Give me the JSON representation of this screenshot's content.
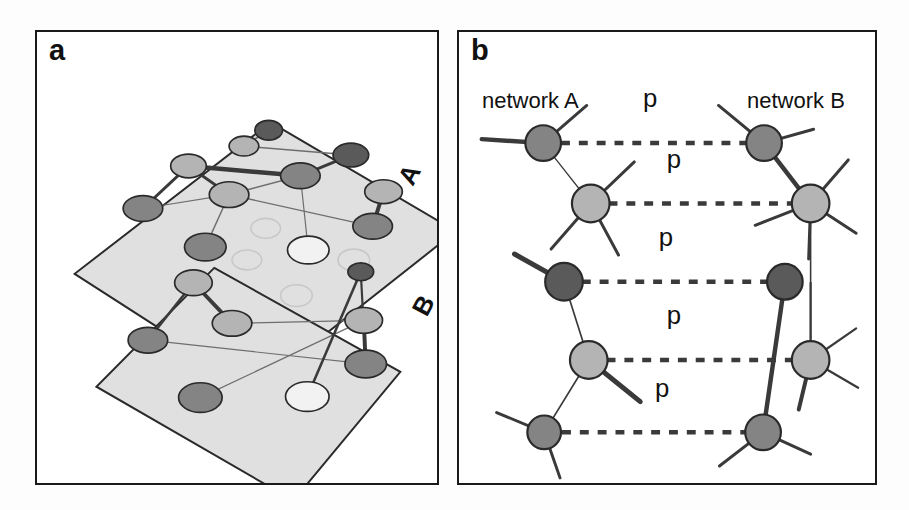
{
  "figure": {
    "width": 909,
    "height": 510,
    "background": "#ffffff",
    "style": "grayscale scientific schematic of two interdependent networks"
  },
  "colors": {
    "node_dark": "#5a5a5a",
    "node_medium": "#848484",
    "node_light": "#b4b4b4",
    "node_pale": "#d2d2d2",
    "node_white": "#f2f2f2",
    "node_stroke": "#2a2a2a",
    "plane_fill": "#e0e0e0",
    "plane_stroke": "#2a2a2a",
    "edge": "#3a3a3a",
    "edge_thin": "#6e6e6e",
    "ghost": "#c8c8c8",
    "frame": "#1a1a1a",
    "text": "#111111"
  },
  "panel_a": {
    "letter": "a",
    "plane_labels": [
      {
        "name": "plane-label-A",
        "text": "A",
        "x": 386,
        "y": 150,
        "rotation": -62
      },
      {
        "name": "plane-label-B",
        "text": "B",
        "x": 400,
        "y": 282,
        "rotation": -62
      }
    ],
    "planes": [
      {
        "name": "plane-A",
        "points": "238,93 425,203 222,363 40,246"
      },
      {
        "name": "plane-B",
        "points": "181,240 369,345 261,475 62,360"
      }
    ],
    "nodes_plane_a": [
      {
        "id": "a1",
        "x": 236,
        "y": 101,
        "rx": 14,
        "ry": 10,
        "shade": "node_dark"
      },
      {
        "id": "a2",
        "x": 211,
        "y": 117,
        "rx": 15,
        "ry": 10,
        "shade": "node_light"
      },
      {
        "id": "a3",
        "x": 319,
        "y": 126,
        "rx": 18,
        "ry": 12,
        "shade": "node_dark"
      },
      {
        "id": "a4",
        "x": 155,
        "y": 137,
        "rx": 18,
        "ry": 12,
        "shade": "node_light"
      },
      {
        "id": "a5",
        "x": 268,
        "y": 147,
        "rx": 20,
        "ry": 13,
        "shade": "node_medium"
      },
      {
        "id": "a6",
        "x": 196,
        "y": 166,
        "rx": 20,
        "ry": 13,
        "shade": "node_light"
      },
      {
        "id": "a7",
        "x": 109,
        "y": 180,
        "rx": 20,
        "ry": 13,
        "shade": "node_medium"
      },
      {
        "id": "a8",
        "x": 352,
        "y": 163,
        "rx": 19,
        "ry": 12,
        "shade": "node_light"
      },
      {
        "id": "a9",
        "x": 341,
        "y": 198,
        "rx": 20,
        "ry": 13,
        "shade": "node_medium"
      },
      {
        "id": "a10",
        "x": 172,
        "y": 219,
        "rx": 21,
        "ry": 14,
        "shade": "node_medium"
      },
      {
        "id": "a11",
        "x": 276,
        "y": 222,
        "rx": 21,
        "ry": 14,
        "shade": "node_white"
      }
    ],
    "ghost_nodes": [
      {
        "id": "g1",
        "x": 233,
        "y": 200,
        "rx": 15,
        "ry": 10
      },
      {
        "id": "g2",
        "x": 214,
        "y": 232,
        "rx": 15,
        "ry": 10
      },
      {
        "id": "g3",
        "x": 322,
        "y": 232,
        "rx": 16,
        "ry": 11
      },
      {
        "id": "g4",
        "x": 264,
        "y": 268,
        "rx": 16,
        "ry": 11
      }
    ],
    "edges_plane_a": [
      {
        "from": "a1",
        "to": "a2",
        "w": 2.0
      },
      {
        "from": "a2",
        "to": "a3",
        "w": 1.6
      },
      {
        "from": "a3",
        "to": "a5",
        "w": 3.0
      },
      {
        "from": "a4",
        "to": "a5",
        "w": 4.5
      },
      {
        "from": "a4",
        "to": "a6",
        "w": 3.0
      },
      {
        "from": "a4",
        "to": "a7",
        "w": 3.0
      },
      {
        "from": "a6",
        "to": "a7",
        "w": 1.2
      },
      {
        "from": "a6",
        "to": "a5",
        "w": 1.6
      },
      {
        "from": "a6",
        "to": "a10",
        "w": 1.4
      },
      {
        "from": "a8",
        "to": "a9",
        "w": 4.0
      },
      {
        "from": "a5",
        "to": "a11",
        "w": 1.2
      },
      {
        "from": "a6",
        "to": "a9",
        "w": 1.4
      }
    ],
    "nodes_plane_b": [
      {
        "id": "b1",
        "x": 160,
        "y": 255,
        "rx": 19,
        "ry": 13,
        "shade": "node_light"
      },
      {
        "id": "b2",
        "x": 332,
        "y": 293,
        "rx": 19,
        "ry": 13,
        "shade": "node_light"
      },
      {
        "id": "b3",
        "x": 199,
        "y": 296,
        "rx": 20,
        "ry": 13,
        "shade": "node_light"
      },
      {
        "id": "b4",
        "x": 114,
        "y": 313,
        "rx": 20,
        "ry": 13,
        "shade": "node_medium"
      },
      {
        "id": "b5",
        "x": 334,
        "y": 337,
        "rx": 21,
        "ry": 14,
        "shade": "node_medium"
      },
      {
        "id": "b6",
        "x": 167,
        "y": 371,
        "rx": 22,
        "ry": 15,
        "shade": "node_medium"
      },
      {
        "id": "b7",
        "x": 275,
        "y": 370,
        "rx": 22,
        "ry": 15,
        "shade": "node_white"
      },
      {
        "id": "b8",
        "x": 329,
        "y": 244,
        "rx": 13,
        "ry": 9,
        "shade": "node_dark"
      }
    ],
    "edges_plane_b": [
      {
        "from": "b1",
        "to": "b3",
        "w": 4.0
      },
      {
        "from": "b1",
        "to": "b4",
        "w": 2.6
      },
      {
        "from": "b2",
        "to": "b5",
        "w": 4.0
      },
      {
        "from": "b3",
        "to": "b2",
        "w": 1.4
      },
      {
        "from": "b4",
        "to": "b5",
        "w": 1.2
      },
      {
        "from": "b6",
        "to": "b2",
        "w": 1.2
      },
      {
        "from": "b7",
        "to": "b8",
        "w": 2.6
      },
      {
        "from": "b5",
        "to": "b8",
        "w": 2.2
      }
    ]
  },
  "panel_b": {
    "letter": "b",
    "network_a_title": "network A",
    "network_b_title": "network B",
    "dependency_label": "p",
    "dependency_links": [
      {
        "id": "p1",
        "label": "p",
        "from": "A1",
        "to": "B1",
        "y": 142,
        "x1": 560,
        "x2": 747,
        "label_x": 650,
        "label_y": 106
      },
      {
        "id": "p2",
        "label": "p",
        "from": "A2",
        "to": "B2",
        "y": 203,
        "x1": 608,
        "x2": 795,
        "label_x": 674,
        "label_y": 167
      },
      {
        "id": "p3",
        "label": "p",
        "from": "A3",
        "to": "B3",
        "y": 282,
        "x1": 581,
        "x2": 768,
        "label_x": 666,
        "label_y": 246
      },
      {
        "id": "p4",
        "label": "p",
        "from": "A4",
        "to": "B4",
        "y": 361,
        "x1": 606,
        "x2": 794,
        "label_x": 674,
        "label_y": 325
      },
      {
        "id": "p5",
        "label": "p",
        "from": "A5",
        "to": "B5",
        "y": 434,
        "x1": 561,
        "x2": 746,
        "label_x": 662,
        "label_y": 398
      }
    ],
    "network_a_nodes": [
      {
        "id": "A1",
        "x": 542,
        "y": 142,
        "r": 18,
        "shade": "node_medium"
      },
      {
        "id": "A2",
        "x": 590,
        "y": 203,
        "r": 19,
        "shade": "node_light"
      },
      {
        "id": "A3",
        "x": 563,
        "y": 282,
        "r": 19,
        "shade": "node_dark"
      },
      {
        "id": "A4",
        "x": 588,
        "y": 361,
        "r": 19,
        "shade": "node_light"
      },
      {
        "id": "A5",
        "x": 543,
        "y": 434,
        "r": 17,
        "shade": "node_medium"
      }
    ],
    "network_b_nodes": [
      {
        "id": "B1",
        "x": 765,
        "y": 142,
        "r": 18,
        "shade": "node_medium"
      },
      {
        "id": "B2",
        "x": 812,
        "y": 203,
        "r": 19,
        "shade": "node_light"
      },
      {
        "id": "B3",
        "x": 786,
        "y": 282,
        "r": 18,
        "shade": "node_dark"
      },
      {
        "id": "B4",
        "x": 812,
        "y": 361,
        "r": 19,
        "shade": "node_light"
      },
      {
        "id": "B5",
        "x": 764,
        "y": 434,
        "r": 18,
        "shade": "node_medium"
      }
    ],
    "internal_edges": [
      {
        "from": "A1",
        "to": "A2",
        "w": 1.3
      },
      {
        "from": "A3",
        "to": "A4",
        "w": 1.7
      },
      {
        "from": "A4",
        "to": "A5",
        "w": 1.7
      },
      {
        "from": "B1",
        "to": "B2",
        "w": 4.5
      },
      {
        "from": "B3",
        "to": "B5",
        "w": 4.5
      },
      {
        "from": "B2",
        "to": "B4",
        "w": 1.6
      }
    ],
    "stub_edges": [
      {
        "node": "A1",
        "dx": -62,
        "dy": -4,
        "w": 4.5
      },
      {
        "node": "A1",
        "dx": 44,
        "dy": -38,
        "w": 3.0
      },
      {
        "node": "A2",
        "dx": 44,
        "dy": -42,
        "w": 3.0
      },
      {
        "node": "A2",
        "dx": -40,
        "dy": 46,
        "w": 3.0
      },
      {
        "node": "A2",
        "dx": 28,
        "dy": 52,
        "w": 3.0
      },
      {
        "node": "A3",
        "dx": -50,
        "dy": -28,
        "w": 5.0
      },
      {
        "node": "A4",
        "dx": 52,
        "dy": 42,
        "w": 5.0
      },
      {
        "node": "A5",
        "dx": -48,
        "dy": -20,
        "w": 3.0
      },
      {
        "node": "A5",
        "dx": 16,
        "dy": 46,
        "w": 3.0
      },
      {
        "node": "B1",
        "dx": -46,
        "dy": -38,
        "w": 3.0
      },
      {
        "node": "B1",
        "dx": 50,
        "dy": -14,
        "w": 3.0
      },
      {
        "node": "B2",
        "dx": 38,
        "dy": -44,
        "w": 3.0
      },
      {
        "node": "B2",
        "dx": -56,
        "dy": 22,
        "w": 3.0
      },
      {
        "node": "B2",
        "dx": 46,
        "dy": 30,
        "w": 3.0
      },
      {
        "node": "B2",
        "dx": -2,
        "dy": 56,
        "w": 3.0
      },
      {
        "node": "B4",
        "dx": 46,
        "dy": -32,
        "w": 2.2
      },
      {
        "node": "B4",
        "dx": 48,
        "dy": 28,
        "w": 2.2
      },
      {
        "node": "B4",
        "dx": -12,
        "dy": 50,
        "w": 4.0
      },
      {
        "node": "B4",
        "dx": 0,
        "dy": -78,
        "w": 2.2
      },
      {
        "node": "B5",
        "dx": -44,
        "dy": 34,
        "w": 3.0
      },
      {
        "node": "B5",
        "dx": 48,
        "dy": 22,
        "w": 3.0
      }
    ]
  }
}
